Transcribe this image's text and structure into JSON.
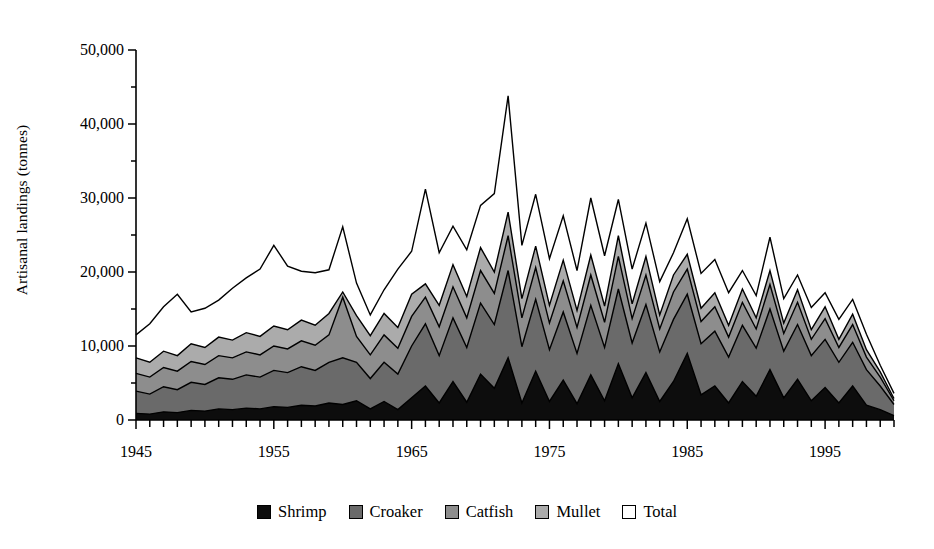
{
  "chart_data": {
    "type": "area",
    "title": "",
    "xlabel": "",
    "ylabel": "Artisanal landings (tonnes)",
    "stacked": true,
    "grid": false,
    "legend_position": "bottom",
    "xlim": [
      1945,
      2000
    ],
    "ylim": [
      0,
      50000
    ],
    "y_ticks": [
      0,
      10000,
      20000,
      30000,
      40000,
      50000
    ],
    "y_tick_labels": [
      "0",
      "10,000",
      "20,000",
      "30,000",
      "40,000",
      "50,000"
    ],
    "y_minor_tick_interval": 5000,
    "x_ticks": [
      1945,
      1955,
      1965,
      1975,
      1985,
      1995
    ],
    "x_tick_labels": [
      "1945",
      "1955",
      "1965",
      "1975",
      "1985",
      "1995"
    ],
    "x_minor_tick_interval": 1,
    "x": [
      1945,
      1946,
      1947,
      1948,
      1949,
      1950,
      1951,
      1952,
      1953,
      1954,
      1955,
      1956,
      1957,
      1958,
      1959,
      1960,
      1961,
      1962,
      1963,
      1964,
      1965,
      1966,
      1967,
      1968,
      1969,
      1970,
      1971,
      1972,
      1973,
      1974,
      1975,
      1976,
      1977,
      1978,
      1979,
      1980,
      1981,
      1982,
      1983,
      1984,
      1985,
      1986,
      1987,
      1988,
      1989,
      1990,
      1991,
      1992,
      1993,
      1994,
      1995,
      1996,
      1997,
      1998,
      1999,
      2000
    ],
    "series": [
      {
        "name": "Shrimp",
        "color": "#0d0d0d",
        "values": [
          900,
          800,
          1100,
          1000,
          1300,
          1200,
          1500,
          1400,
          1600,
          1500,
          1800,
          1700,
          2000,
          1900,
          2300,
          2100,
          2600,
          1500,
          2500,
          1400,
          3000,
          4600,
          2300,
          5200,
          2400,
          6200,
          4300,
          8400,
          2300,
          6600,
          2500,
          5400,
          2200,
          6100,
          2600,
          7600,
          3000,
          6400,
          2500,
          5200,
          9000,
          3400,
          4600,
          2300,
          5200,
          3200,
          6800,
          3000,
          5500,
          2600,
          4400,
          2300,
          4600,
          2000,
          1400,
          600
        ]
      },
      {
        "name": "Croaker",
        "color": "#6a6a6a",
        "values": [
          3000,
          2700,
          3400,
          3100,
          3800,
          3600,
          4200,
          4100,
          4500,
          4300,
          4900,
          4700,
          5200,
          4800,
          5500,
          6300,
          5200,
          4100,
          5300,
          4800,
          7000,
          8400,
          6400,
          8600,
          7400,
          9600,
          8600,
          11800,
          7600,
          9700,
          7000,
          9200,
          6800,
          9400,
          7200,
          10100,
          7400,
          9200,
          6700,
          8400,
          8000,
          6900,
          7400,
          6200,
          7600,
          6500,
          8200,
          6300,
          7400,
          6100,
          6500,
          5500,
          5900,
          4800,
          3200,
          1500
        ]
      },
      {
        "name": "Catfish",
        "color": "#8d8d8d",
        "values": [
          2400,
          2300,
          2600,
          2500,
          2800,
          2700,
          3000,
          2900,
          3100,
          3000,
          3300,
          3200,
          3500,
          3400,
          3700,
          8200,
          3500,
          3200,
          3700,
          3500,
          4000,
          3600,
          3900,
          4200,
          4000,
          4400,
          4200,
          4700,
          3900,
          4300,
          3600,
          4200,
          3500,
          4100,
          3400,
          4400,
          3300,
          4000,
          3100,
          3700,
          3400,
          3000,
          3300,
          2700,
          3100,
          2600,
          3300,
          2400,
          3000,
          2200,
          2800,
          2000,
          2400,
          1700,
          1200,
          500
        ]
      },
      {
        "name": "Mullet",
        "color": "#ababab",
        "values": [
          2100,
          2000,
          2200,
          2100,
          2400,
          2300,
          2500,
          2400,
          2600,
          2500,
          2700,
          2600,
          2800,
          2700,
          2900,
          700,
          2800,
          2600,
          2900,
          2800,
          3000,
          1800,
          2900,
          3000,
          2900,
          3100,
          2900,
          3200,
          2600,
          2900,
          2400,
          2800,
          2300,
          2700,
          2200,
          2800,
          2000,
          2500,
          1900,
          2300,
          2000,
          1800,
          1900,
          1600,
          1800,
          1500,
          1900,
          1400,
          1700,
          1300,
          1600,
          1100,
          1400,
          1000,
          700,
          300
        ]
      },
      {
        "name": "Total",
        "color": "#ffffff",
        "values": [
          11500,
          13000,
          15300,
          17000,
          14600,
          15100,
          16200,
          17800,
          19200,
          20400,
          23600,
          20800,
          20100,
          19900,
          20300,
          26100,
          18500,
          14200,
          17600,
          20400,
          22800,
          31200,
          22600,
          26200,
          23000,
          29000,
          30600,
          43800,
          23600,
          30500,
          21800,
          27600,
          20200,
          30000,
          22200,
          29800,
          20400,
          26600,
          18700,
          22600,
          27200,
          19800,
          21700,
          17200,
          20200,
          16800,
          24700,
          16400,
          19600,
          15200,
          17200,
          13600,
          16300,
          11600,
          7400,
          3600
        ]
      }
    ]
  },
  "legend": {
    "items": [
      {
        "label": "Shrimp",
        "color": "#0d0d0d"
      },
      {
        "label": "Croaker",
        "color": "#6a6a6a"
      },
      {
        "label": "Catfish",
        "color": "#8d8d8d"
      },
      {
        "label": "Mullet",
        "color": "#ababab"
      },
      {
        "label": "Total",
        "color": "#ffffff"
      }
    ]
  }
}
